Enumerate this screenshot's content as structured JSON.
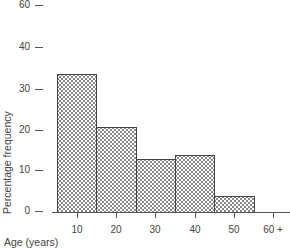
{
  "chart_data": {
    "type": "bar",
    "subtype": "histogram",
    "title": "",
    "xlabel": "Age (years)",
    "ylabel": "Percentage frequency",
    "categories": [
      "0-15",
      "15-25",
      "25-35",
      "35-45",
      "45-55",
      "55+"
    ],
    "bin_edges": [
      5,
      15,
      25,
      35,
      45,
      55
    ],
    "values": [
      34,
      21,
      13,
      14,
      4,
      0
    ],
    "x_ticks": [
      "10",
      "20",
      "30",
      "40",
      "50",
      "60 +"
    ],
    "y_ticks": [
      "0",
      "10",
      "20",
      "30",
      "40",
      "60"
    ],
    "ylim": [
      0,
      60
    ],
    "grid": false,
    "legend": null
  },
  "layout": {
    "y_zero_px": 211,
    "px_per_unit": 4.07,
    "x_ticks_px": [
      77,
      116,
      155,
      195,
      234,
      273
    ],
    "y_ticks_px": [
      211,
      170,
      130,
      89,
      47,
      5
    ],
    "bars_px": [
      {
        "left": 57,
        "right": 96
      },
      {
        "left": 96,
        "right": 136
      },
      {
        "left": 136,
        "right": 175
      },
      {
        "left": 175,
        "right": 214
      },
      {
        "left": 214,
        "right": 254
      }
    ]
  }
}
